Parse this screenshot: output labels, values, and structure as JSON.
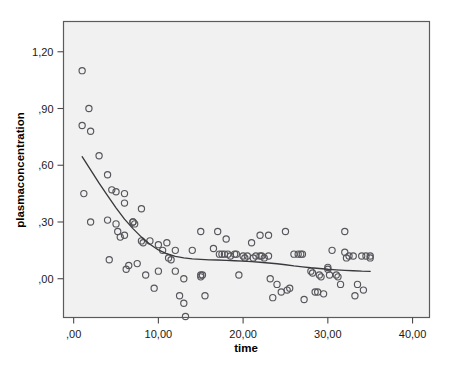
{
  "figure": {
    "name": "plasmaconcentration-vs-time-scatterplot",
    "background_color": "#ffffff",
    "plot_area_color": "#f1f1f1",
    "frame_color": "#5b5b5b",
    "marker_color": "#56565c",
    "fit_line_color": "#3a3a3e"
  },
  "chart_data": {
    "type": "scatter",
    "title": "",
    "subtitle": "",
    "xlabel": "time",
    "ylabel": "plasmaconcentration",
    "xlim": [
      -1.2,
      42.0
    ],
    "ylim": [
      -0.205,
      1.36
    ],
    "grid": false,
    "legend": null,
    "legend_position": "none",
    "xticks": [
      0,
      10,
      20,
      30,
      40
    ],
    "xticklabels": [
      ",00",
      "10,00",
      "20,00",
      "30,00",
      "40,00"
    ],
    "yticks": [
      0.0,
      0.3,
      0.6,
      0.9,
      1.2
    ],
    "yticklabels": [
      ",00",
      ",30",
      ",60",
      ",90",
      "1,20"
    ],
    "marker": "open-circle",
    "marker_size": 4.2,
    "series": [
      {
        "name": "observations",
        "x": [
          1.0,
          1.0,
          1.2,
          1.8,
          2.0,
          2.0,
          3.0,
          4.0,
          4.0,
          4.2,
          4.5,
          5.0,
          5.0,
          5.2,
          5.5,
          6.0,
          6.0,
          6.0,
          6.2,
          6.5,
          7.0,
          7.0,
          7.2,
          7.5,
          8.0,
          8.0,
          8.2,
          8.5,
          9.0,
          9.5,
          10.0,
          10.0,
          10.5,
          11.0,
          11.2,
          11.5,
          12.0,
          12.0,
          12.5,
          13.0,
          13.0,
          13.2,
          14.0,
          15.0,
          15.0,
          15.0,
          15.2,
          15.5,
          16.5,
          17.0,
          17.2,
          17.5,
          17.8,
          18.0,
          18.2,
          18.5,
          19.0,
          19.2,
          19.5,
          20.0,
          20.2,
          20.5,
          21.0,
          21.2,
          21.5,
          22.0,
          22.0,
          22.2,
          22.5,
          23.0,
          23.0,
          23.2,
          23.5,
          24.0,
          24.5,
          25.0,
          25.2,
          25.5,
          26.0,
          26.5,
          26.8,
          27.0,
          27.2,
          28.0,
          28.2,
          28.5,
          28.8,
          29.0,
          29.2,
          29.5,
          30.0,
          30.0,
          30.2,
          30.5,
          31.0,
          31.2,
          31.5,
          32.0,
          32.0,
          32.2,
          32.5,
          33.0,
          33.2,
          33.5,
          34.0,
          34.2,
          34.5,
          35.0,
          35.0
        ],
        "y": [
          1.1,
          0.81,
          0.45,
          0.9,
          0.78,
          0.3,
          0.65,
          0.55,
          0.31,
          0.1,
          0.47,
          0.46,
          0.29,
          0.25,
          0.22,
          0.45,
          0.4,
          0.23,
          0.05,
          0.07,
          0.3,
          0.3,
          0.29,
          0.08,
          0.37,
          0.2,
          0.19,
          0.02,
          0.2,
          -0.05,
          0.18,
          0.04,
          0.15,
          0.19,
          0.11,
          0.1,
          0.15,
          0.04,
          -0.09,
          -0.13,
          0.0,
          -0.2,
          0.15,
          0.25,
          0.02,
          0.01,
          0.02,
          -0.09,
          0.16,
          0.25,
          0.13,
          0.13,
          0.13,
          0.21,
          0.13,
          0.12,
          0.13,
          0.13,
          0.02,
          0.12,
          0.11,
          0.12,
          0.19,
          0.11,
          0.12,
          0.23,
          0.12,
          0.12,
          0.11,
          0.23,
          0.12,
          0.0,
          -0.1,
          -0.03,
          -0.07,
          0.25,
          -0.06,
          -0.05,
          0.13,
          0.13,
          0.13,
          0.13,
          -0.11,
          0.04,
          0.03,
          -0.07,
          -0.07,
          0.02,
          0.01,
          -0.08,
          0.06,
          0.05,
          0.02,
          0.15,
          0.02,
          0.01,
          -0.03,
          0.25,
          0.14,
          0.11,
          0.12,
          0.12,
          -0.09,
          -0.03,
          0.12,
          -0.06,
          0.12,
          0.12,
          0.11
        ]
      }
    ],
    "fit_curve": {
      "name": "loess-fit-line",
      "x": [
        1.0,
        2.0,
        3.0,
        4.0,
        5.0,
        6.0,
        7.0,
        8.0,
        9.0,
        10.0,
        11.0,
        12.0,
        13.0,
        14.0,
        15.0,
        16.0,
        17.0,
        18.0,
        19.0,
        20.0,
        21.0,
        22.0,
        23.0,
        24.0,
        25.0,
        26.0,
        27.0,
        28.0,
        29.0,
        30.0,
        31.0,
        32.0,
        33.0,
        34.0,
        35.0
      ],
      "y": [
        0.645,
        0.575,
        0.505,
        0.44,
        0.375,
        0.315,
        0.265,
        0.22,
        0.182,
        0.152,
        0.132,
        0.118,
        0.11,
        0.105,
        0.102,
        0.1,
        0.099,
        0.097,
        0.095,
        0.093,
        0.09,
        0.087,
        0.083,
        0.079,
        0.074,
        0.068,
        0.063,
        0.058,
        0.054,
        0.05,
        0.047,
        0.044,
        0.042,
        0.04,
        0.039
      ]
    }
  }
}
